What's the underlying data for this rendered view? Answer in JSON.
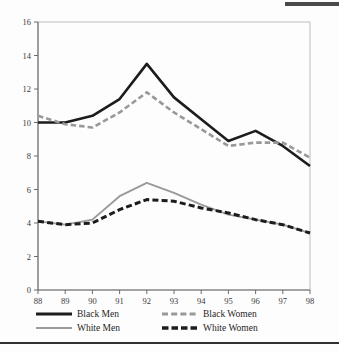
{
  "figure": {
    "top_rule_color": "#4a4a4a",
    "bottom_rule_color": "#2f2f2f",
    "background": "#fdfdfd"
  },
  "chart_data": {
    "type": "line",
    "title": "",
    "subtitle": "",
    "xlabel": "",
    "ylabel": "",
    "categories": [
      "88",
      "89",
      "90",
      "91",
      "92",
      "93",
      "94",
      "95",
      "96",
      "97",
      "98"
    ],
    "x": [
      88,
      89,
      90,
      91,
      92,
      93,
      94,
      95,
      96,
      97,
      98
    ],
    "xlim": [
      88,
      98
    ],
    "ylim": [
      0,
      16
    ],
    "yticks": [
      0,
      2,
      4,
      6,
      8,
      10,
      12,
      14,
      16
    ],
    "ytick_labels": [
      "0",
      "2",
      "4",
      "6",
      "8",
      "10",
      "12",
      "14",
      "16"
    ],
    "xtick_labels": [
      "88",
      "89",
      "90",
      "91",
      "92",
      "93",
      "94",
      "95",
      "96",
      "97",
      "98"
    ],
    "grid": false,
    "legend_position": "bottom",
    "series": [
      {
        "name": "Black Men",
        "color": "#1c1c1c",
        "style": "solid",
        "width": 2.6,
        "values": [
          10.0,
          10.0,
          10.4,
          11.4,
          13.5,
          11.5,
          10.2,
          8.9,
          9.5,
          8.6,
          7.4
        ]
      },
      {
        "name": "Black Women",
        "color": "#999999",
        "style": "dashed",
        "width": 2.6,
        "values": [
          10.4,
          9.9,
          9.7,
          10.6,
          11.8,
          10.6,
          9.6,
          8.6,
          8.8,
          8.8,
          7.9
        ]
      },
      {
        "name": "White Men",
        "color": "#9a9a9a",
        "style": "solid",
        "width": 1.9,
        "values": [
          4.1,
          3.9,
          4.2,
          5.6,
          6.4,
          5.8,
          5.1,
          4.5,
          4.2,
          3.9,
          3.4
        ]
      },
      {
        "name": "White Women",
        "color": "#1c1c1c",
        "style": "dashed",
        "width": 3.0,
        "values": [
          4.1,
          3.9,
          4.0,
          4.8,
          5.4,
          5.3,
          4.9,
          4.6,
          4.2,
          3.9,
          3.4
        ]
      }
    ]
  },
  "legend": {
    "entries": [
      {
        "label": "Black Men",
        "color": "#1c1c1c",
        "style": "solid",
        "width": 3.0
      },
      {
        "label": "Black Women",
        "color": "#999999",
        "style": "dashed",
        "width": 3.0
      },
      {
        "label": "White Men",
        "color": "#9a9a9a",
        "style": "solid",
        "width": 1.8
      },
      {
        "label": "White Women",
        "color": "#1c1c1c",
        "style": "dashed",
        "width": 3.4
      }
    ]
  },
  "axes": {
    "frame_color": "#b4b4b4",
    "axis_color": "#6a6a6a",
    "tick_color": "#6a6a6a"
  }
}
